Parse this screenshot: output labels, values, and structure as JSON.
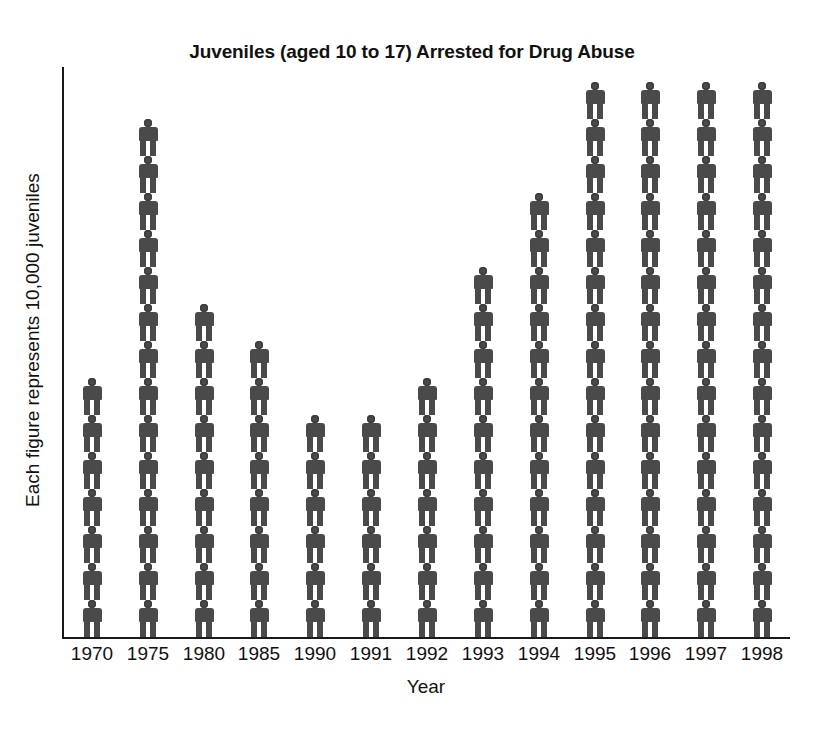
{
  "chart_data": {
    "type": "bar",
    "subtype": "pictograph",
    "title": "Juveniles (aged 10 to 17) Arrested for Drug Abuse",
    "xlabel": "Year",
    "ylabel": "Each figure represents 10,000 juveniles",
    "unit_per_figure": 10000,
    "grid": false,
    "legend": "none",
    "categories": [
      "1970",
      "1975",
      "1980",
      "1985",
      "1990",
      "1991",
      "1992",
      "1993",
      "1994",
      "1995",
      "1996",
      "1997",
      "1998"
    ],
    "figure_counts": [
      7,
      14,
      9,
      8,
      6,
      6,
      7,
      10,
      12,
      15,
      15,
      15,
      15
    ],
    "values": [
      70000,
      140000,
      90000,
      80000,
      60000,
      60000,
      70000,
      100000,
      120000,
      150000,
      150000,
      150000,
      150000
    ],
    "ylim": [
      0,
      150000
    ],
    "series": [
      {
        "name": "Juveniles arrested for drug abuse",
        "values": [
          70000,
          140000,
          90000,
          80000,
          60000,
          60000,
          70000,
          100000,
          120000,
          150000,
          150000,
          150000,
          150000
        ]
      }
    ],
    "colors": {
      "figure": "#4a4a4a",
      "axis": "#1a1a1a",
      "text": "#111111",
      "background": "#ffffff"
    }
  },
  "icons": {
    "person": "person-pictogram-icon"
  }
}
